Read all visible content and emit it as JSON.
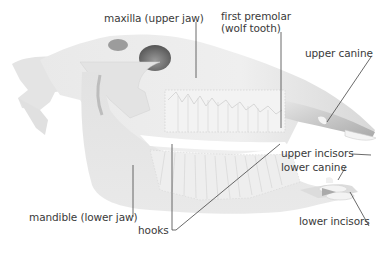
{
  "diagram": {
    "colors": {
      "bone_light": "#ececec",
      "bone_mid": "#d6d6d6",
      "bone_dark": "#8a8a8a",
      "teeth": "#f7f7f7",
      "leader_line": "#444444",
      "label_text": "#3a3a3a"
    },
    "labels": [
      {
        "id": "maxilla",
        "text": "maxilla (upper jaw)"
      },
      {
        "id": "first_premolar",
        "text": "first premolar\n(wolf tooth)"
      },
      {
        "id": "upper_canine",
        "text": "upper canine"
      },
      {
        "id": "upper_incisors",
        "text": "upper incisors"
      },
      {
        "id": "lower_canine",
        "text": "lower canine"
      },
      {
        "id": "mandible",
        "text": "mandible (lower jaw)"
      },
      {
        "id": "hooks",
        "text": "hooks"
      },
      {
        "id": "lower_incisors",
        "text": "lower incisors"
      }
    ]
  }
}
